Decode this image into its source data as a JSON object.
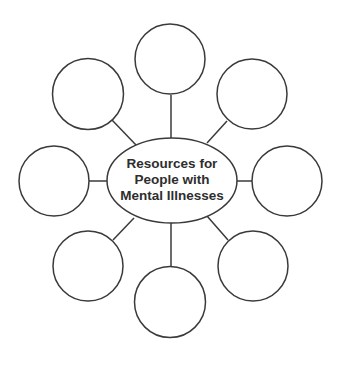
{
  "diagram": {
    "type": "concept-web",
    "center": {
      "lines": [
        "Resources for",
        "People with",
        "Mental Illnesses"
      ]
    },
    "satellites": [
      {
        "position": "top",
        "label": ""
      },
      {
        "position": "upper-right",
        "label": ""
      },
      {
        "position": "right",
        "label": ""
      },
      {
        "position": "lower-right",
        "label": ""
      },
      {
        "position": "bottom",
        "label": ""
      },
      {
        "position": "lower-left",
        "label": ""
      },
      {
        "position": "left",
        "label": ""
      },
      {
        "position": "upper-left",
        "label": ""
      }
    ],
    "colors": {
      "stroke": "#3a3a3a",
      "text": "#2e2e2e",
      "background": "#ffffff"
    }
  }
}
